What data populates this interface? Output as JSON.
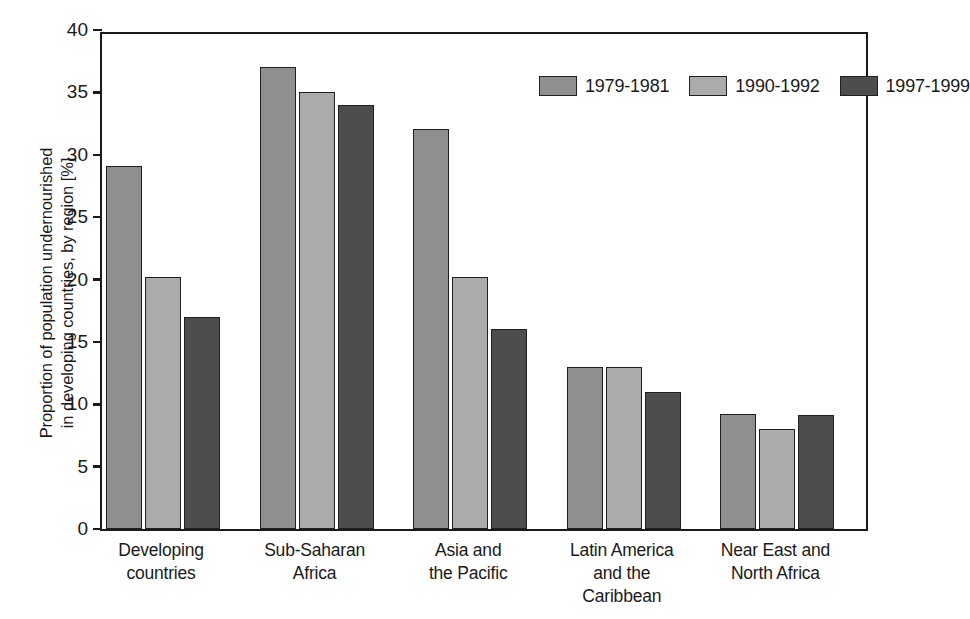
{
  "chart_data": {
    "type": "bar",
    "title": "",
    "xlabel": "",
    "ylabel": "Proportion of population undernourished in developing countries, by region [%]",
    "ylabel_lines": [
      "Proportion of population undernourished",
      "in developing countries, by region [%]"
    ],
    "ylim": [
      0,
      40
    ],
    "yticks": [
      0,
      5,
      10,
      15,
      20,
      25,
      30,
      35,
      40
    ],
    "ytick_labels": [
      "0",
      "5",
      "10",
      "15",
      "20",
      "25",
      "30",
      "35",
      "40"
    ],
    "grid": false,
    "legend_position": "top-right inside axes",
    "categories": [
      "Developing countries",
      "Sub-Saharan Africa",
      "Asia and the Pacific",
      "Latin America and the Caribbean",
      "Near East and North Africa"
    ],
    "category_lines": [
      [
        "Developing",
        "countries"
      ],
      [
        "Sub-Saharan",
        "Africa"
      ],
      [
        "Asia and",
        "the Pacific"
      ],
      [
        "Latin America",
        "and the",
        "Caribbean"
      ],
      [
        "Near East and",
        "North Africa"
      ]
    ],
    "series": [
      {
        "name": "1979-1981",
        "color": "#8f8f8f",
        "values": [
          29.1,
          37.0,
          32.1,
          13.0,
          9.2
        ]
      },
      {
        "name": "1990-1992",
        "color": "#ababab",
        "values": [
          20.2,
          35.0,
          20.2,
          13.0,
          8.0
        ]
      },
      {
        "name": "1997-1999",
        "color": "#4d4d4d",
        "values": [
          17.0,
          34.0,
          16.0,
          11.0,
          9.1
        ]
      }
    ]
  },
  "legend": {
    "items": [
      {
        "label": "1979-1981",
        "color": "#8f8f8f"
      },
      {
        "label": "1990-1992",
        "color": "#ababab"
      },
      {
        "label": "1997-1999",
        "color": "#4d4d4d"
      }
    ]
  },
  "axis": {
    "y_title_line1": "Proportion of population undernourished",
    "y_title_line2": "in developing countries, by region [%]",
    "y_ticks": [
      "40",
      "35",
      "30",
      "25",
      "20",
      "15",
      "10",
      "5",
      "0"
    ]
  }
}
